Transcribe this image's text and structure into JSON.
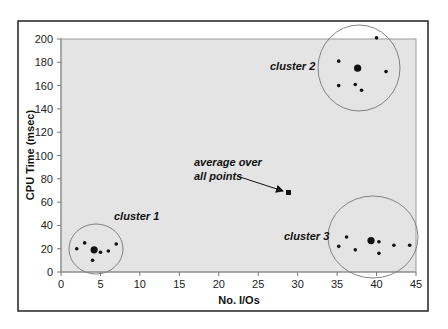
{
  "chart_data": {
    "type": "scatter",
    "title": "",
    "xlabel": "No. I/Os",
    "ylabel": "CPU Time (msec)",
    "xlim": [
      0,
      45
    ],
    "ylim": [
      0,
      200
    ],
    "x_ticks": [
      0,
      5,
      10,
      15,
      20,
      25,
      30,
      35,
      40,
      45
    ],
    "y_ticks": [
      0,
      20,
      40,
      60,
      80,
      100,
      120,
      140,
      160,
      180,
      200
    ],
    "grid": false,
    "legend": null,
    "plot_background": "#e4e4e4",
    "series": [
      {
        "name": "cluster 1",
        "points": [
          [
            2,
            20
          ],
          [
            3,
            25
          ],
          [
            4,
            10
          ],
          [
            5,
            17
          ],
          [
            6,
            18
          ],
          [
            7,
            24
          ]
        ],
        "centroid": [
          4.2,
          19
        ]
      },
      {
        "name": "cluster 2",
        "points": [
          [
            40,
            201
          ],
          [
            35.2,
            181
          ],
          [
            41.2,
            172
          ],
          [
            35.2,
            160
          ],
          [
            37.3,
            161
          ],
          [
            38.1,
            156
          ]
        ],
        "centroid": [
          37.6,
          175
        ]
      },
      {
        "name": "cluster 3",
        "points": [
          [
            35.2,
            22
          ],
          [
            36.2,
            30
          ],
          [
            37.3,
            19
          ],
          [
            40.3,
            26
          ],
          [
            40.3,
            16
          ],
          [
            42.2,
            23
          ],
          [
            44.2,
            23
          ]
        ],
        "centroid": [
          39.3,
          27
        ]
      }
    ],
    "average_point": {
      "label": "average over all points",
      "x": 28.9,
      "y": 68
    },
    "annotations": [
      {
        "text": "cluster 1",
        "x": 6.7,
        "y": 45
      },
      {
        "text": "cluster 2",
        "x": 26.5,
        "y": 174
      },
      {
        "text": "cluster 3",
        "x": 28.2,
        "y": 27
      },
      {
        "text": "average over",
        "x": 17,
        "y": 94
      },
      {
        "text": "all points",
        "x": 17,
        "y": 82
      }
    ]
  },
  "labels": {
    "xlabel": "No. I/Os",
    "ylabel": "CPU Time (msec)",
    "cluster1": "cluster 1",
    "cluster2": "cluster 2",
    "cluster3": "cluster 3",
    "avg_line1": "average over",
    "avg_line2": "all points"
  }
}
